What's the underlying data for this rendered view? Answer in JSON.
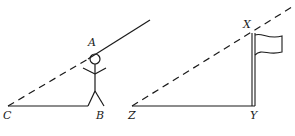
{
  "diagram": {
    "left_figure": {
      "labels": {
        "A": "A",
        "B": "B",
        "C": "C"
      },
      "description": "Person standing at B with eye level at A; line of sight from C through A"
    },
    "right_figure": {
      "labels": {
        "X": "X",
        "Y": "Y",
        "Z": "Z"
      },
      "description": "Flagpole XY with ground line ZY; dashed line from Z to top X"
    },
    "colors": {
      "stroke": "#1a1a1a",
      "background": "#ffffff"
    }
  }
}
